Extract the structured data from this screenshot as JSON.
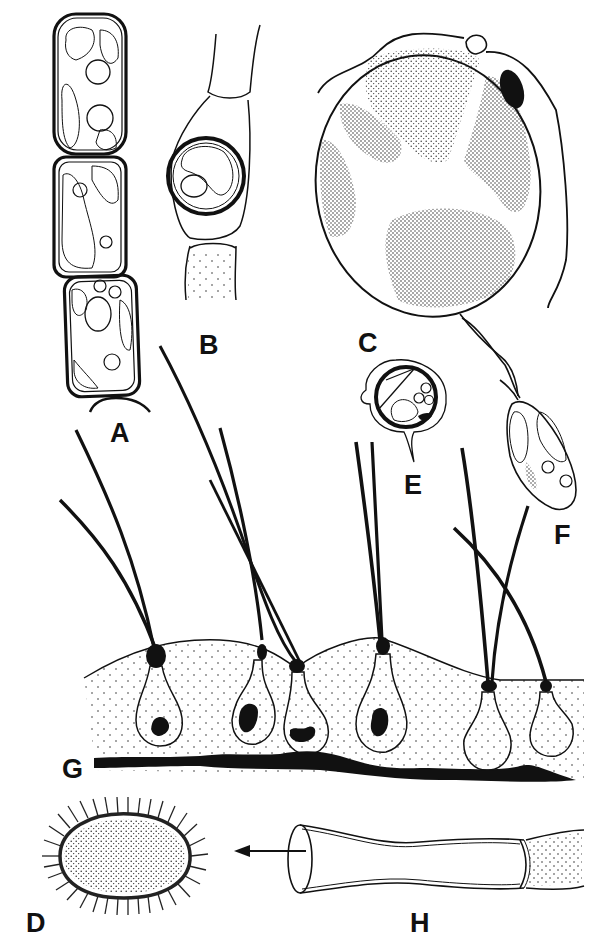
{
  "figure": {
    "type": "scientific-illustration-plate",
    "background": "#ffffff",
    "ink_color": "#111111",
    "panels": [
      {
        "id": "A",
        "label": "A",
        "description": "filament of three cells with chloroplasts and vacuoles"
      },
      {
        "id": "B",
        "label": "B",
        "description": "filament with a round thick-walled spore in the middle cell"
      },
      {
        "id": "C",
        "label": "C",
        "description": "large biflagellate cell with an eyespot"
      },
      {
        "id": "D",
        "label": "D",
        "description": "oval spore with a spiny outer wall"
      },
      {
        "id": "E",
        "label": "E",
        "description": "small encysted cell with a thick wall"
      },
      {
        "id": "F",
        "label": "F",
        "description": "small biflagellate swarmer"
      },
      {
        "id": "G",
        "label": "G",
        "description": "hair-bearing cells set in host tissue"
      },
      {
        "id": "H",
        "label": "H",
        "description": "empty cell wall, arrow pointing to D"
      }
    ]
  }
}
